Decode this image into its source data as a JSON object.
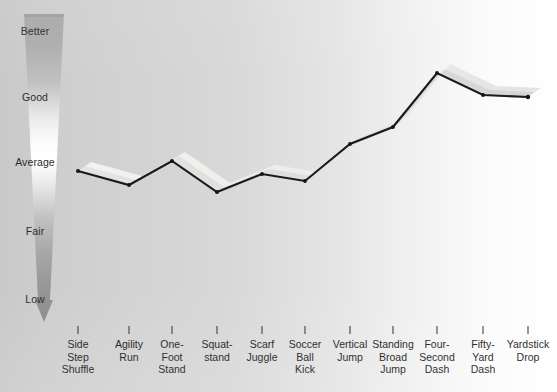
{
  "chart_data": {
    "type": "line",
    "title": "",
    "subtitle": "",
    "xlabel": "",
    "ylabel": "",
    "grid": false,
    "legend": "none",
    "annotation": "Vertical gradient arrow axis labelled Better / Good / Average / Fair / Low, pointing downward",
    "y_scale_labels": [
      "Better",
      "Good",
      "Average",
      "Fair",
      "Low"
    ],
    "y_scale_positions_px": [
      32,
      98,
      163,
      232,
      300
    ],
    "ylim": [
      0,
      5
    ],
    "categories": [
      "Side Step Shuffle",
      "Agility Run",
      "One-Foot Stand",
      "Squat-stand",
      "Scarf Juggle",
      "Soccer Ball Kick",
      "Vertical Jump",
      "Standing Broad Jump",
      "Four-Second Dash",
      "Fifty-Yard Dash",
      "Yardstick Drop"
    ],
    "categories_multiline": [
      [
        "Side",
        "Step",
        "Shuffle"
      ],
      [
        "Agility",
        "Run"
      ],
      [
        "One-",
        "Foot",
        "Stand"
      ],
      [
        "Squat-",
        "stand"
      ],
      [
        "Scarf",
        "Juggle"
      ],
      [
        "Soccer",
        "Ball",
        "Kick"
      ],
      [
        "Vertical",
        "Jump"
      ],
      [
        "Standing",
        "Broad",
        "Jump"
      ],
      [
        "Four-",
        "Second",
        "Dash"
      ],
      [
        "Fifty-",
        "Yard",
        "Dash"
      ],
      [
        "Yardstick",
        "Drop"
      ]
    ],
    "series": [
      {
        "name": "Performance",
        "values": [
          2.94,
          2.72,
          3.09,
          2.58,
          2.86,
          2.75,
          3.32,
          3.62,
          4.5,
          4.16,
          4.13
        ],
        "points_px": [
          [
            78,
            171
          ],
          [
            129,
            185
          ],
          [
            172,
            161
          ],
          [
            217,
            192
          ],
          [
            262,
            174
          ],
          [
            305,
            181
          ],
          [
            350,
            144
          ],
          [
            393,
            127
          ],
          [
            437,
            73
          ],
          [
            483,
            95
          ],
          [
            528,
            97
          ]
        ]
      }
    ],
    "colors": {
      "line": "#1a1a1a",
      "ribbon_top": "#f2f2f0",
      "ribbon_side": "#b9b9b6",
      "arrow_top": "#a9a9a9",
      "arrow_mid": "#ffffff",
      "arrow_bottom": "#8e8e8e",
      "background_left": "#c9c9c9",
      "background_right": "#ffffff",
      "tick": "#3a3a3a",
      "text": "#1c1c1c"
    }
  },
  "axis": {
    "tick_positions_px": [
      78,
      129,
      172,
      217,
      262,
      305,
      350,
      393,
      437,
      483,
      528
    ],
    "tick_top_px": 326,
    "tick_bottom_px": 334
  }
}
